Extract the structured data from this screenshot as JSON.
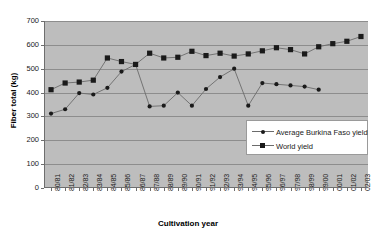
{
  "chart_data": {
    "type": "line",
    "title": "",
    "xlabel": "Cultivation year",
    "ylabel": "Fiber total (kg)",
    "ylim": [
      0,
      700
    ],
    "ytick_step": 100,
    "yticks": [
      0,
      100,
      200,
      300,
      400,
      500,
      600,
      700
    ],
    "grid": true,
    "legend_position": "inside-right",
    "plot_background": "#bdbdbd",
    "categories": [
      "80/81",
      "81/82",
      "82/83",
      "83/84",
      "84/85",
      "85/86",
      "86/87",
      "87/88",
      "88/89",
      "89/90",
      "90/91",
      "91/92",
      "92/93",
      "93/94",
      "94/95",
      "95/96",
      "96/97",
      "97/98",
      "98/99",
      "99/00",
      "00/01",
      "01/02",
      "02/03"
    ],
    "series": [
      {
        "name": "Average Burkina Faso yield",
        "marker": "circle",
        "color": "#1a1a1a",
        "line_color": "#6b6b6b",
        "values": [
          312,
          330,
          398,
          392,
          420,
          488,
          518,
          342,
          345,
          400,
          345,
          415,
          465,
          500,
          345,
          440,
          435,
          430,
          425,
          412,
          null,
          null,
          null
        ]
      },
      {
        "name": "World yield",
        "marker": "square",
        "color": "#1a1a1a",
        "line_color": "#6b6b6b",
        "values": [
          412,
          440,
          444,
          452,
          545,
          530,
          518,
          565,
          545,
          548,
          573,
          555,
          565,
          553,
          562,
          575,
          588,
          580,
          562,
          592,
          605,
          615,
          635
        ]
      }
    ]
  }
}
